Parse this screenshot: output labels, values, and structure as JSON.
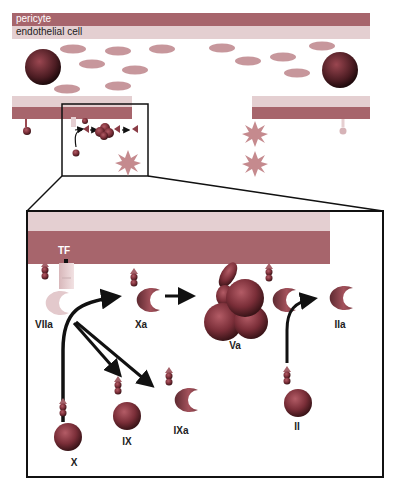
{
  "vessel": {
    "layer_labels": {
      "pericyte": "pericyte",
      "endothelial": "endothelial cell"
    }
  },
  "detail": {
    "tf_label": "TF",
    "factors": {
      "VIIa": "VIIa",
      "Xa": "Xa",
      "Va": "Va",
      "IIa": "IIa",
      "X": "X",
      "IX": "IX",
      "IXa": "IXa",
      "II": "II"
    }
  },
  "colors": {
    "pericyte": "#b9767d",
    "endothelial": "#e9d2d4",
    "platelet": "#c99aa0",
    "star": "#c97d80",
    "factor": "#8a3c46",
    "outline": "#111111"
  }
}
